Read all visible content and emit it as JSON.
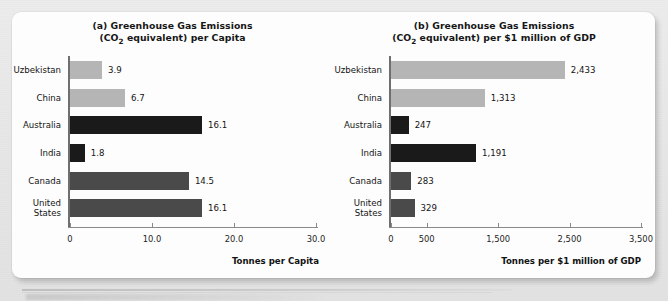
{
  "figure": {
    "background_color": "#e9e9e9",
    "card_color": "#fdfdfd"
  },
  "colors": {
    "light_gray": "#b5b5b5",
    "black": "#1a1a1a",
    "dark_gray": "#4a4a4a"
  },
  "chart_data": [
    {
      "type": "bar",
      "orientation": "horizontal",
      "panel": "a",
      "title_line1": "(a) Greenhouse Gas Emissions",
      "title_line2_pre": "(CO",
      "title_line2_sub": "2",
      "title_line2_post": " equivalent) per Capita",
      "title": "(a) Greenhouse Gas Emissions (CO2 equivalent) per Capita",
      "categories": [
        "Uzbekistan",
        "China",
        "Australia",
        "India",
        "Canada",
        "United\nStates"
      ],
      "values": [
        3.9,
        6.7,
        16.1,
        1.8,
        14.5,
        16.1
      ],
      "value_labels": [
        "3.9",
        "6.7",
        "16.1",
        "1.8",
        "14.5",
        "16.1"
      ],
      "bar_colors": [
        "#b5b5b5",
        "#b5b5b5",
        "#1a1a1a",
        "#1a1a1a",
        "#4a4a4a",
        "#4a4a4a"
      ],
      "xlabel": "Tonnes per Capita",
      "ylabel": "",
      "xlim": [
        0,
        30
      ],
      "xticks": [
        0,
        10,
        20,
        30
      ],
      "xtick_labels": [
        "0",
        "10.0",
        "20.0",
        "30.0"
      ],
      "grid": false,
      "legend": "none"
    },
    {
      "type": "bar",
      "orientation": "horizontal",
      "panel": "b",
      "title_line1": "(b) Greenhouse Gas Emissions",
      "title_line2_pre": "(CO",
      "title_line2_sub": "2",
      "title_line2_post": " equivalent) per $1 million of GDP",
      "title": "(b) Greenhouse Gas Emissions (CO2 equivalent) per $1 million of GDP",
      "categories": [
        "Uzbekistan",
        "China",
        "Australia",
        "India",
        "Canada",
        "United\nStates"
      ],
      "values": [
        2433,
        1313,
        247,
        1191,
        283,
        329
      ],
      "value_labels": [
        "2,433",
        "1,313",
        "247",
        "1,191",
        "283",
        "329"
      ],
      "bar_colors": [
        "#b5b5b5",
        "#b5b5b5",
        "#1a1a1a",
        "#1a1a1a",
        "#4a4a4a",
        "#4a4a4a"
      ],
      "xlabel": "Tonnes per $1 million of GDP",
      "ylabel": "",
      "xlim": [
        0,
        3500
      ],
      "xticks": [
        0,
        500,
        1500,
        2500,
        3500
      ],
      "xtick_labels": [
        "0",
        "500",
        "1,500",
        "2,500",
        "3,500"
      ],
      "grid": false,
      "legend": "none"
    }
  ]
}
